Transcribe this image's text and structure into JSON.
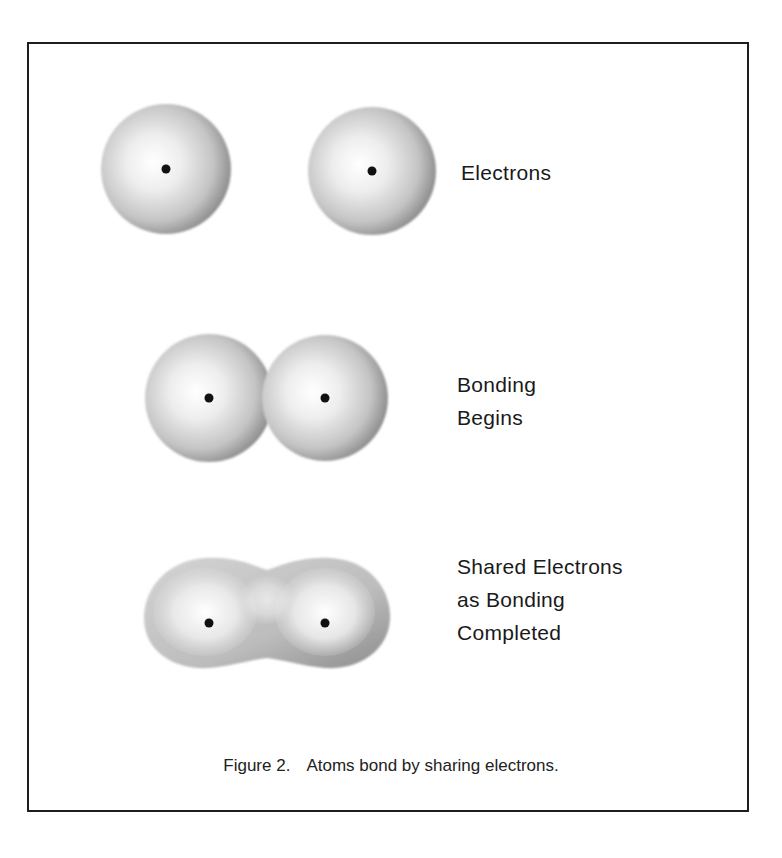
{
  "figure": {
    "number_label": "Figure 2.",
    "caption": "Atoms bond by sharing electrons."
  },
  "stages": [
    {
      "id": "separate",
      "label_lines": [
        "Electrons"
      ]
    },
    {
      "id": "begins",
      "label_lines": [
        "Bonding",
        "Begins"
      ]
    },
    {
      "id": "completed",
      "label_lines": [
        "Shared Electrons",
        "as Bonding",
        "Completed"
      ]
    }
  ],
  "colors": {
    "frame": "#1e1e1e",
    "sphere_light": "#ffffff",
    "sphere_mid": "#d2d2d2",
    "sphere_dark": "#7a7a7a",
    "nucleus": "#111111",
    "text": "#1a1a1a"
  }
}
